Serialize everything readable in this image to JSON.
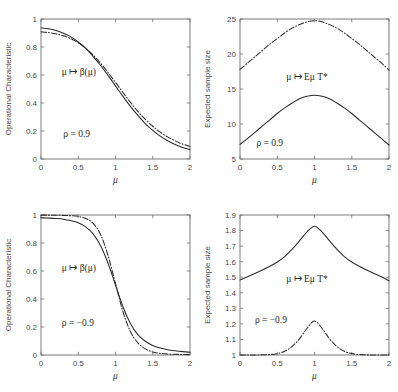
{
  "figure": {
    "background": "#ffffff",
    "line_color": "#2b2b2b",
    "axis_color": "#6e6e6e",
    "width": 398,
    "height": 392
  },
  "chart_data": [
    {
      "id": "top-left",
      "type": "line",
      "title": "",
      "xlabel": "μ",
      "ylabel": "Operational Characteristic",
      "xlim": [
        0,
        2
      ],
      "ylim": [
        0,
        1
      ],
      "xticks": [
        "0",
        "0.5",
        "1",
        "1.5",
        "2"
      ],
      "xtick_values": [
        0,
        0.5,
        1,
        1.5,
        2
      ],
      "yticks": [
        "0",
        "0.2",
        "0.4",
        "0.6",
        "0.8",
        "1"
      ],
      "ytick_values": [
        0,
        0.2,
        0.4,
        0.6,
        0.8,
        1
      ],
      "grid": false,
      "legend": "none",
      "annotations": [
        {
          "text": "μ ↦ β(μ)",
          "x": 0.28,
          "y": 0.6
        },
        {
          "text": "ρ = 0.9",
          "x": 0.3,
          "y": 0.16
        }
      ],
      "x": [
        0,
        0.1,
        0.2,
        0.3,
        0.4,
        0.5,
        0.6,
        0.7,
        0.8,
        0.9,
        1.0,
        1.1,
        1.2,
        1.3,
        1.4,
        1.5,
        1.6,
        1.7,
        1.8,
        1.9,
        2.0
      ],
      "series": [
        {
          "name": "solid",
          "style": "solid",
          "values": [
            0.937,
            0.93,
            0.917,
            0.898,
            0.872,
            0.836,
            0.79,
            0.733,
            0.668,
            0.597,
            0.522,
            0.447,
            0.376,
            0.311,
            0.253,
            0.204,
            0.163,
            0.13,
            0.104,
            0.083,
            0.067
          ]
        },
        {
          "name": "dash-dot",
          "style": "dashdot",
          "values": [
            0.908,
            0.903,
            0.894,
            0.88,
            0.859,
            0.83,
            0.791,
            0.742,
            0.684,
            0.618,
            0.547,
            0.475,
            0.405,
            0.34,
            0.283,
            0.234,
            0.192,
            0.158,
            0.13,
            0.107,
            0.09
          ]
        }
      ]
    },
    {
      "id": "top-right",
      "type": "line",
      "title": "",
      "xlabel": "μ",
      "ylabel": "Expected sample size",
      "xlim": [
        0,
        2
      ],
      "ylim": [
        5,
        25
      ],
      "xticks": [
        "0",
        "0.5",
        "1",
        "1.5",
        "2"
      ],
      "xtick_values": [
        0,
        0.5,
        1,
        1.5,
        2
      ],
      "yticks": [
        "5",
        "10",
        "15",
        "20",
        "25"
      ],
      "ytick_values": [
        5,
        10,
        15,
        20,
        25
      ],
      "grid": false,
      "legend": "none",
      "annotations": [
        {
          "text": "μ ↦ Eμ T*",
          "x": 0.62,
          "y": 16.3
        },
        {
          "text": "ρ = 0.9",
          "x": 0.22,
          "y": 6.9
        }
      ],
      "x": [
        0,
        0.1,
        0.2,
        0.3,
        0.4,
        0.5,
        0.6,
        0.7,
        0.8,
        0.9,
        1.0,
        1.1,
        1.2,
        1.3,
        1.4,
        1.5,
        1.6,
        1.7,
        1.8,
        1.9,
        2.0
      ],
      "series": [
        {
          "name": "solid",
          "style": "solid",
          "values": [
            7.1,
            7.9,
            8.8,
            9.7,
            10.6,
            11.5,
            12.3,
            13.0,
            13.6,
            13.95,
            14.1,
            13.95,
            13.6,
            13.0,
            12.3,
            11.5,
            10.6,
            9.7,
            8.8,
            7.9,
            7.0
          ]
        },
        {
          "name": "dash-dot",
          "style": "dashdot",
          "values": [
            17.8,
            18.7,
            19.6,
            20.5,
            21.4,
            22.2,
            23.0,
            23.7,
            24.2,
            24.6,
            24.75,
            24.6,
            24.2,
            23.7,
            23.0,
            22.2,
            21.4,
            20.5,
            19.6,
            18.7,
            17.7
          ]
        }
      ]
    },
    {
      "id": "bottom-left",
      "type": "line",
      "title": "",
      "xlabel": "μ",
      "ylabel": "Operational Characteristic",
      "xlim": [
        0,
        2
      ],
      "ylim": [
        0,
        1
      ],
      "xticks": [
        "0",
        "0.5",
        "1",
        "1.5",
        "2"
      ],
      "xtick_values": [
        0,
        0.5,
        1,
        1.5,
        2
      ],
      "yticks": [
        "0",
        "0.2",
        "0.4",
        "0.6",
        "0.8",
        "1"
      ],
      "ytick_values": [
        0,
        0.2,
        0.4,
        0.6,
        0.8,
        1
      ],
      "grid": false,
      "legend": "none",
      "annotations": [
        {
          "text": "μ ↦ β(μ)",
          "x": 0.28,
          "y": 0.6
        },
        {
          "text": "ρ = −0.9",
          "x": 0.28,
          "y": 0.21
        }
      ],
      "x": [
        0,
        0.1,
        0.2,
        0.3,
        0.4,
        0.5,
        0.6,
        0.7,
        0.8,
        0.9,
        1.0,
        1.1,
        1.2,
        1.3,
        1.4,
        1.5,
        1.6,
        1.7,
        1.8,
        1.9,
        2.0
      ],
      "series": [
        {
          "name": "solid",
          "style": "solid",
          "values": [
            0.98,
            0.978,
            0.975,
            0.97,
            0.96,
            0.944,
            0.915,
            0.865,
            0.78,
            0.655,
            0.5,
            0.345,
            0.225,
            0.145,
            0.098,
            0.068,
            0.05,
            0.038,
            0.03,
            0.024,
            0.02
          ]
        },
        {
          "name": "dash-dot",
          "style": "dashdot",
          "values": [
            0.999,
            0.999,
            0.998,
            0.997,
            0.995,
            0.99,
            0.975,
            0.94,
            0.86,
            0.71,
            0.51,
            0.31,
            0.168,
            0.087,
            0.044,
            0.022,
            0.012,
            0.007,
            0.005,
            0.004,
            0.003
          ]
        }
      ]
    },
    {
      "id": "bottom-right",
      "type": "line",
      "title": "",
      "xlabel": "μ",
      "ylabel": "Expected sample size",
      "xlim": [
        0,
        2
      ],
      "ylim": [
        1,
        1.9
      ],
      "xticks": [
        "0",
        "0.5",
        "1",
        "1.5",
        "2"
      ],
      "xtick_values": [
        0,
        0.5,
        1,
        1.5,
        2
      ],
      "yticks": [
        "1",
        "1.1",
        "1.2",
        "1.3",
        "1.4",
        "1.5",
        "1.6",
        "1.7",
        "1.8",
        "1.9"
      ],
      "ytick_values": [
        1,
        1.1,
        1.2,
        1.3,
        1.4,
        1.5,
        1.6,
        1.7,
        1.8,
        1.9
      ],
      "grid": false,
      "legend": "none",
      "annotations": [
        {
          "text": "μ ↦ Eμ T*",
          "x": 0.62,
          "y": 1.47
        },
        {
          "text": "ρ = −0.9",
          "x": 0.2,
          "y": 1.205
        }
      ],
      "x": [
        0,
        0.1,
        0.2,
        0.3,
        0.4,
        0.5,
        0.6,
        0.7,
        0.8,
        0.9,
        1.0,
        1.1,
        1.2,
        1.3,
        1.4,
        1.5,
        1.6,
        1.7,
        1.8,
        1.9,
        2.0
      ],
      "series": [
        {
          "name": "solid",
          "style": "solid",
          "values": [
            1.482,
            1.503,
            1.524,
            1.546,
            1.57,
            1.598,
            1.633,
            1.68,
            1.735,
            1.792,
            1.828,
            1.792,
            1.735,
            1.68,
            1.633,
            1.598,
            1.57,
            1.546,
            1.524,
            1.503,
            1.477
          ]
        },
        {
          "name": "dash-dot",
          "style": "dashdot",
          "values": [
            1.0,
            1.0,
            1.0,
            1.001,
            1.003,
            1.009,
            1.024,
            1.055,
            1.105,
            1.172,
            1.218,
            1.172,
            1.105,
            1.055,
            1.024,
            1.009,
            1.003,
            1.001,
            1.0,
            1.0,
            1.0
          ]
        }
      ]
    }
  ]
}
